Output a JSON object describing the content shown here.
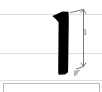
{
  "document": {
    "kind": "scanned-technical-drawing-fragment",
    "background_color": "#ffffff"
  },
  "drawing": {
    "shape": {
      "name": "black-profile-bar",
      "description": "heavy black vertical bar with a flag serif at the top-left and a tapered foot",
      "fill_color": "#000000"
    },
    "dimension": {
      "bracket_name": "vertical-dimension-bracket",
      "label": "1",
      "line_color": "#7a7a7a"
    },
    "guides": [
      {
        "name": "upper-guide-rule",
        "color": "#dcdcdc"
      },
      {
        "name": "middle-guide-rule",
        "color": "#dcdcdc"
      }
    ]
  },
  "footer": {
    "divider_color": "#e2e2e2",
    "frame_border_color": "#b9b9b9"
  }
}
